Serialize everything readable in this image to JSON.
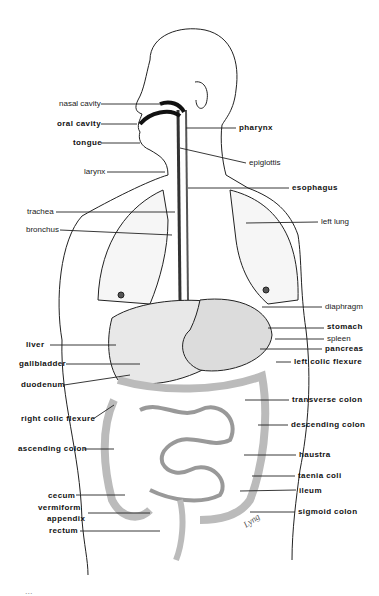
{
  "figure": {
    "left_labels": [
      {
        "text": "nasal cavity",
        "bold": false,
        "x": 59,
        "y": 99,
        "lx1": 101,
        "ly1": 104,
        "lx2": 160,
        "ly2": 104
      },
      {
        "text": "oral cavity",
        "bold": true,
        "x": 57,
        "y": 119,
        "lx1": 101,
        "ly1": 124,
        "lx2": 137,
        "ly2": 124
      },
      {
        "text": "tongue",
        "bold": true,
        "x": 73,
        "y": 138,
        "lx1": 101,
        "ly1": 143,
        "lx2": 140,
        "ly2": 143
      },
      {
        "text": "larynx",
        "bold": false,
        "x": 84,
        "y": 167,
        "lx1": 107,
        "ly1": 172,
        "lx2": 165,
        "ly2": 172
      },
      {
        "text": "trachea",
        "bold": false,
        "x": 27,
        "y": 207,
        "lx1": 56,
        "ly1": 212,
        "lx2": 175,
        "ly2": 212
      },
      {
        "text": "bronchus",
        "bold": false,
        "x": 26,
        "y": 225,
        "lx1": 60,
        "ly1": 230,
        "lx2": 172,
        "ly2": 235
      },
      {
        "text": "liver",
        "bold": true,
        "x": 26,
        "y": 340,
        "lx1": 50,
        "ly1": 345,
        "lx2": 116,
        "ly2": 345
      },
      {
        "text": "gallbladder",
        "bold": true,
        "x": 19,
        "y": 359,
        "lx1": 66,
        "ly1": 364,
        "lx2": 140,
        "ly2": 364
      },
      {
        "text": "duodenum",
        "bold": true,
        "x": 21,
        "y": 380,
        "lx1": 64,
        "ly1": 385,
        "lx2": 130,
        "ly2": 375
      },
      {
        "text": "right colic flexure",
        "bold": true,
        "x": 21,
        "y": 414,
        "lx1": 93,
        "ly1": 419,
        "lx2": 114,
        "ly2": 405
      },
      {
        "text": "ascending colon",
        "bold": true,
        "x": 18,
        "y": 444,
        "lx1": 84,
        "ly1": 449,
        "lx2": 114,
        "ly2": 449
      },
      {
        "text": "cecum",
        "bold": true,
        "x": 48,
        "y": 491,
        "lx1": 76,
        "ly1": 495,
        "lx2": 125,
        "ly2": 495
      },
      {
        "text": "vermiform",
        "bold": true,
        "x": 38,
        "y": 503,
        "lx1": 88,
        "ly1": 513,
        "lx2": 150,
        "ly2": 513
      },
      {
        "text": "appendix",
        "bold": true,
        "x": 47,
        "y": 514,
        "lx1": 0,
        "ly1": 0,
        "lx2": 0,
        "ly2": 0
      },
      {
        "text": "rectum",
        "bold": true,
        "x": 49,
        "y": 526,
        "lx1": 80,
        "ly1": 531,
        "lx2": 160,
        "ly2": 531
      }
    ],
    "right_labels": [
      {
        "text": "pharynx",
        "bold": true,
        "x": 239,
        "y": 123,
        "lx1": 186,
        "ly1": 128,
        "lx2": 236,
        "ly2": 128
      },
      {
        "text": "epiglottis",
        "bold": false,
        "x": 249,
        "y": 158,
        "lx1": 180,
        "ly1": 148,
        "lx2": 246,
        "ly2": 163
      },
      {
        "text": "esophagus",
        "bold": true,
        "x": 292,
        "y": 183,
        "lx1": 188,
        "ly1": 188,
        "lx2": 289,
        "ly2": 188
      },
      {
        "text": "left lung",
        "bold": false,
        "x": 321,
        "y": 217,
        "lx1": 246,
        "ly1": 223,
        "lx2": 318,
        "ly2": 222
      },
      {
        "text": "diaphragm",
        "bold": false,
        "x": 325,
        "y": 302,
        "lx1": 262,
        "ly1": 307,
        "lx2": 322,
        "ly2": 307
      },
      {
        "text": "stomach",
        "bold": true,
        "x": 327,
        "y": 322,
        "lx1": 268,
        "ly1": 328,
        "lx2": 324,
        "ly2": 328
      },
      {
        "text": "spleen",
        "bold": false,
        "x": 327,
        "y": 334,
        "lx1": 275,
        "ly1": 339,
        "lx2": 324,
        "ly2": 339
      },
      {
        "text": "pancreas",
        "bold": true,
        "x": 325,
        "y": 344,
        "lx1": 260,
        "ly1": 349,
        "lx2": 322,
        "ly2": 349
      },
      {
        "text": "left colic flexure",
        "bold": true,
        "x": 294,
        "y": 357,
        "lx1": 276,
        "ly1": 362,
        "lx2": 291,
        "ly2": 362
      },
      {
        "text": "transverse colon",
        "bold": true,
        "x": 292,
        "y": 395,
        "lx1": 245,
        "ly1": 400,
        "lx2": 289,
        "ly2": 400
      },
      {
        "text": "descending colon",
        "bold": true,
        "x": 291,
        "y": 420,
        "lx1": 258,
        "ly1": 425,
        "lx2": 288,
        "ly2": 425
      },
      {
        "text": "haustra",
        "bold": true,
        "x": 299,
        "y": 450,
        "lx1": 244,
        "ly1": 455,
        "lx2": 296,
        "ly2": 455
      },
      {
        "text": "taenia coli",
        "bold": true,
        "x": 298,
        "y": 471,
        "lx1": 252,
        "ly1": 476,
        "lx2": 295,
        "ly2": 476
      },
      {
        "text": "ileum",
        "bold": true,
        "x": 299,
        "y": 486,
        "lx1": 240,
        "ly1": 491,
        "lx2": 296,
        "ly2": 490
      },
      {
        "text": "sigmoid colon",
        "bold": true,
        "x": 298,
        "y": 507,
        "lx1": 250,
        "ly1": 512,
        "lx2": 295,
        "ly2": 512
      }
    ],
    "signature": "Lyng",
    "caption_partial": "..."
  }
}
